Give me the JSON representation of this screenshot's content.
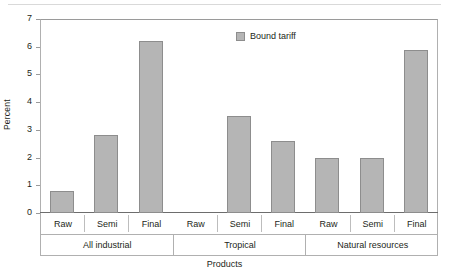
{
  "chart_data": {
    "type": "bar",
    "title": "",
    "xlabel": "Products",
    "ylabel": "Percent",
    "ylim": [
      0,
      7
    ],
    "ytick_labels": [
      "0",
      "1",
      "2",
      "3",
      "4",
      "5",
      "6",
      "7"
    ],
    "grid": false,
    "legend_position": "inside-top-right",
    "series": [
      {
        "name": "Bound tariff",
        "color": "#b5b5b5",
        "values": [
          0.8,
          2.8,
          6.2,
          0,
          3.5,
          2.6,
          2.0,
          2.0,
          5.9
        ]
      }
    ],
    "categories": [
      "Raw",
      "Semi",
      "Final",
      "Raw",
      "Semi",
      "Final",
      "Raw",
      "Semi",
      "Final"
    ],
    "groups": [
      {
        "label": "All industrial",
        "categories": [
          "Raw",
          "Semi",
          "Final"
        ],
        "values": [
          0.8,
          2.8,
          6.2
        ]
      },
      {
        "label": "Tropical",
        "categories": [
          "Raw",
          "Semi",
          "Final"
        ],
        "values": [
          0,
          3.5,
          2.6
        ]
      },
      {
        "label": "Natural resources",
        "categories": [
          "Raw",
          "Semi",
          "Final"
        ],
        "values": [
          2.0,
          2.0,
          5.9
        ]
      }
    ]
  },
  "legend": {
    "entries": [
      {
        "label": "Bound tariff",
        "color": "#b5b5b5"
      }
    ]
  },
  "axes": {
    "y_title": "Percent",
    "x_title": "Products"
  },
  "colors": {
    "bar_fill": "#b5b5b5",
    "bar_border": "#8d8d8d",
    "frame": "#b0b0b0",
    "text": "#231f20"
  }
}
